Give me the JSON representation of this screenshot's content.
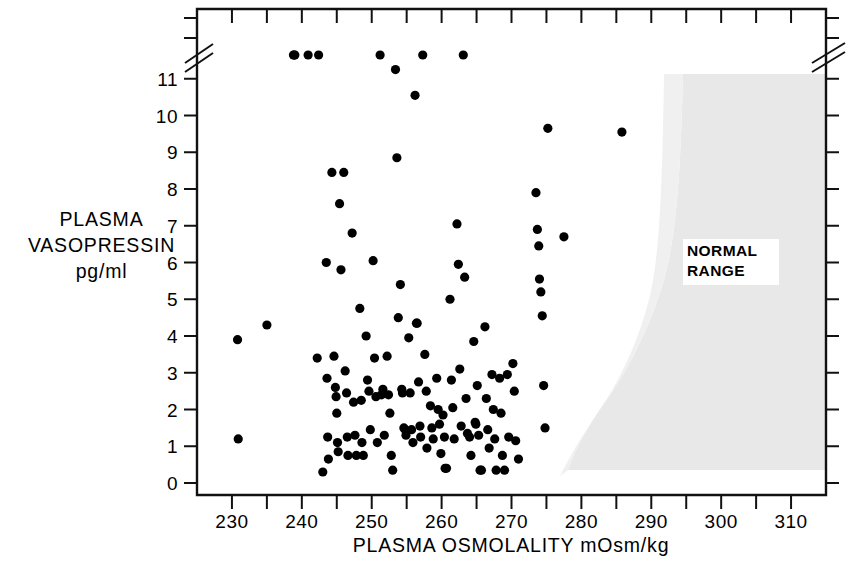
{
  "chart_data": {
    "type": "scatter",
    "title": "",
    "xlabel": "PLASMA OSMOLALITY mOsm/kg",
    "ylabel": "PLASMA VASOPRESSIN pg/ml",
    "ylabel_lines": [
      "PLASMA",
      "VASOPRESSIN",
      "pg/ml"
    ],
    "xlim": [
      225,
      315
    ],
    "ylim": [
      0,
      11.9
    ],
    "x_major_ticks": [
      230,
      240,
      250,
      260,
      270,
      280,
      290,
      300,
      310
    ],
    "x_minor_ticks": [
      235,
      245,
      255,
      265,
      275,
      285,
      295,
      305
    ],
    "x_tick_labels": [
      "230",
      "240",
      "250",
      "260",
      "270",
      "280",
      "290",
      "300",
      "310"
    ],
    "y_major_ticks": [
      0,
      1,
      2,
      3,
      4,
      5,
      6,
      7,
      8,
      9,
      10,
      11
    ],
    "y_tick_labels": [
      "0",
      "1",
      "2",
      "3",
      "4",
      "5",
      "6",
      "7",
      "8",
      "9",
      "10",
      "11"
    ],
    "y_axis_break": true,
    "y_axis_break_note": "axis break above 11; off-scale points plotted in band above break",
    "grid": false,
    "legend": false,
    "marker": "filled-circle",
    "marker_color": "#000000",
    "annotations": [
      {
        "text_lines": [
          "NORMAL",
          "RANGE"
        ],
        "text": "NORMAL RANGE",
        "x": 301,
        "y": 6.1
      }
    ],
    "shaded_regions": [
      {
        "name": "NORMAL RANGE",
        "color": "#e8e8e8",
        "description": "curved band rising from low vasopressin near 281 mOsm/kg to the top of the plot between 289 and 315 mOsm/kg"
      }
    ],
    "points": [
      [
        230.8,
        3.9
      ],
      [
        230.9,
        1.2
      ],
      [
        235.0,
        4.3
      ],
      [
        238.8,
        11.85
      ],
      [
        238.9,
        11.75
      ],
      [
        239.0,
        11.8
      ],
      [
        240.9,
        11.8
      ],
      [
        242.2,
        3.4
      ],
      [
        242.4,
        11.8
      ],
      [
        243.0,
        0.3
      ],
      [
        243.5,
        6.0
      ],
      [
        243.6,
        2.85
      ],
      [
        243.7,
        1.25
      ],
      [
        243.8,
        0.65
      ],
      [
        244.3,
        8.45
      ],
      [
        244.6,
        3.45
      ],
      [
        244.8,
        2.6
      ],
      [
        244.9,
        2.35
      ],
      [
        245.0,
        1.9
      ],
      [
        245.1,
        1.1
      ],
      [
        245.2,
        0.85
      ],
      [
        245.4,
        7.6
      ],
      [
        245.6,
        5.8
      ],
      [
        246.0,
        8.45
      ],
      [
        246.2,
        3.05
      ],
      [
        246.4,
        2.45
      ],
      [
        246.5,
        1.25
      ],
      [
        246.6,
        0.75
      ],
      [
        247.2,
        6.8
      ],
      [
        247.4,
        2.2
      ],
      [
        247.6,
        1.3
      ],
      [
        247.8,
        0.75
      ],
      [
        248.3,
        4.75
      ],
      [
        248.5,
        2.25
      ],
      [
        248.6,
        1.1
      ],
      [
        248.8,
        0.75
      ],
      [
        249.2,
        4.0
      ],
      [
        249.4,
        2.8
      ],
      [
        249.6,
        2.5
      ],
      [
        249.8,
        1.45
      ],
      [
        250.2,
        6.05
      ],
      [
        250.4,
        3.4
      ],
      [
        250.6,
        2.35
      ],
      [
        250.8,
        1.1
      ],
      [
        251.2,
        11.8
      ],
      [
        251.4,
        2.4
      ],
      [
        251.6,
        2.55
      ],
      [
        251.8,
        1.3
      ],
      [
        252.2,
        3.45
      ],
      [
        252.4,
        2.4
      ],
      [
        252.6,
        1.9
      ],
      [
        252.8,
        0.75
      ],
      [
        253.0,
        0.35
      ],
      [
        253.4,
        11.25
      ],
      [
        253.6,
        8.85
      ],
      [
        253.8,
        4.5
      ],
      [
        254.1,
        5.4
      ],
      [
        254.3,
        2.55
      ],
      [
        254.4,
        2.45
      ],
      [
        254.6,
        1.5
      ],
      [
        254.8,
        1.45
      ],
      [
        254.9,
        1.3
      ],
      [
        255.3,
        3.95
      ],
      [
        255.5,
        2.45
      ],
      [
        255.7,
        1.45
      ],
      [
        255.9,
        1.1
      ],
      [
        256.2,
        10.55
      ],
      [
        256.4,
        4.35
      ],
      [
        256.5,
        4.35
      ],
      [
        256.7,
        2.75
      ],
      [
        256.9,
        1.55
      ],
      [
        257.0,
        1.25
      ],
      [
        257.3,
        11.8
      ],
      [
        257.6,
        3.5
      ],
      [
        257.8,
        2.5
      ],
      [
        257.9,
        0.95
      ],
      [
        258.4,
        2.1
      ],
      [
        258.6,
        1.5
      ],
      [
        258.8,
        1.2
      ],
      [
        259.3,
        2.85
      ],
      [
        259.5,
        2.0
      ],
      [
        259.7,
        1.6
      ],
      [
        259.9,
        0.8
      ],
      [
        260.2,
        1.85
      ],
      [
        260.4,
        1.25
      ],
      [
        260.5,
        0.4
      ],
      [
        260.7,
        0.4
      ],
      [
        261.2,
        5.0
      ],
      [
        261.4,
        2.8
      ],
      [
        261.6,
        2.05
      ],
      [
        261.8,
        1.2
      ],
      [
        262.2,
        7.05
      ],
      [
        262.4,
        5.95
      ],
      [
        262.6,
        3.1
      ],
      [
        262.8,
        1.55
      ],
      [
        263.1,
        11.8
      ],
      [
        263.3,
        5.6
      ],
      [
        263.5,
        2.3
      ],
      [
        263.7,
        1.35
      ],
      [
        264.0,
        1.25
      ],
      [
        264.2,
        0.75
      ],
      [
        264.6,
        3.85
      ],
      [
        264.8,
        1.65
      ],
      [
        264.9,
        1.6
      ],
      [
        265.1,
        2.65
      ],
      [
        265.3,
        1.3
      ],
      [
        265.5,
        0.35
      ],
      [
        265.7,
        0.35
      ],
      [
        266.2,
        4.25
      ],
      [
        266.4,
        2.3
      ],
      [
        266.6,
        1.45
      ],
      [
        266.8,
        0.95
      ],
      [
        267.2,
        2.95
      ],
      [
        267.4,
        2.0
      ],
      [
        267.6,
        1.2
      ],
      [
        267.8,
        0.35
      ],
      [
        268.3,
        2.85
      ],
      [
        268.5,
        1.9
      ],
      [
        268.7,
        0.75
      ],
      [
        269.0,
        0.35
      ],
      [
        269.4,
        2.95
      ],
      [
        269.6,
        1.25
      ],
      [
        270.2,
        3.25
      ],
      [
        270.4,
        2.5
      ],
      [
        270.6,
        1.15
      ],
      [
        271.0,
        0.65
      ],
      [
        273.5,
        7.9
      ],
      [
        273.7,
        6.9
      ],
      [
        273.9,
        6.45
      ],
      [
        274.0,
        5.55
      ],
      [
        274.2,
        5.2
      ],
      [
        274.4,
        4.55
      ],
      [
        274.6,
        2.65
      ],
      [
        274.8,
        1.5
      ],
      [
        275.2,
        9.65
      ],
      [
        277.5,
        6.7
      ],
      [
        285.8,
        9.55
      ]
    ]
  }
}
